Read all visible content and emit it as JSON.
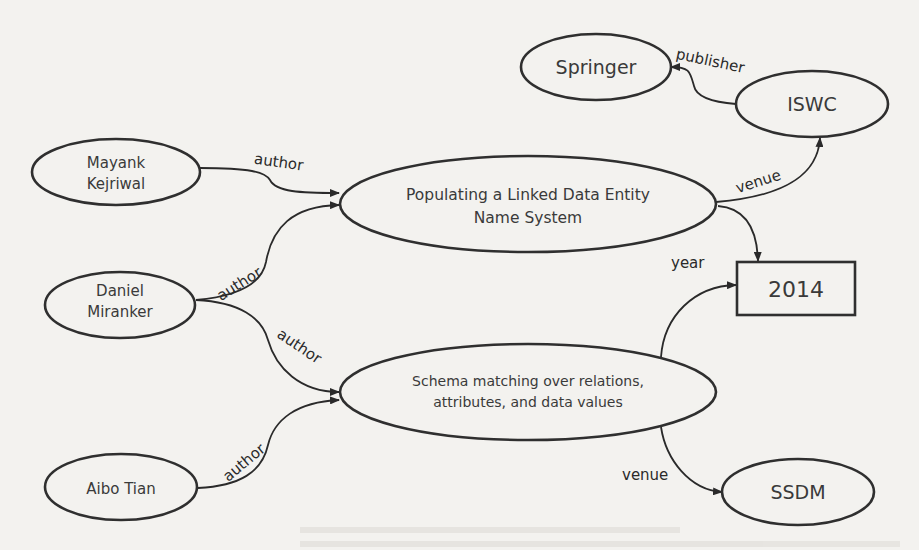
{
  "diagram": {
    "type": "knowledge-graph",
    "nodes": {
      "mayank": {
        "line1": "Mayank",
        "line2": "Kejriwal",
        "shape": "ellipse"
      },
      "daniel": {
        "line1": "Daniel",
        "line2": "Miranker",
        "shape": "ellipse"
      },
      "aibo": {
        "label": "Aibo Tian",
        "shape": "ellipse"
      },
      "paper1": {
        "line1": "Populating a Linked Data Entity",
        "line2": "Name System",
        "shape": "ellipse"
      },
      "paper2": {
        "line1": "Schema matching over relations,",
        "line2": "attributes, and data values",
        "shape": "ellipse"
      },
      "springer": {
        "label": "Springer",
        "shape": "ellipse"
      },
      "iswc": {
        "label": "ISWC",
        "shape": "ellipse"
      },
      "year2014": {
        "label": "2014",
        "shape": "rectangle"
      },
      "ssdm": {
        "label": "SSDM",
        "shape": "ellipse"
      }
    },
    "edges": [
      {
        "from": "Mayank Kejriwal",
        "to": "Populating a Linked Data Entity Name System",
        "label": "author"
      },
      {
        "from": "Daniel Miranker",
        "to": "Populating a Linked Data Entity Name System",
        "label": "author"
      },
      {
        "from": "Daniel Miranker",
        "to": "Schema matching over relations, attributes, and data values",
        "label": "author"
      },
      {
        "from": "Aibo Tian",
        "to": "Schema matching over relations, attributes, and data values",
        "label": "author"
      },
      {
        "from": "Populating a Linked Data Entity Name System",
        "to": "ISWC",
        "label": "venue"
      },
      {
        "from": "ISWC",
        "to": "Springer",
        "label": "publisher"
      },
      {
        "from": "Populating a Linked Data Entity Name System",
        "to": "2014",
        "label": "year"
      },
      {
        "from": "Schema matching over relations, attributes, and data values",
        "to": "2014",
        "label": "year"
      },
      {
        "from": "Schema matching over relations, attributes, and data values",
        "to": "SSDM",
        "label": "venue"
      }
    ],
    "edge_labels": {
      "author_mayank": "author",
      "author_daniel_p1": "author",
      "author_daniel_p2": "author",
      "author_aibo": "author",
      "venue_iswc": "venue",
      "publisher": "publisher",
      "year": "year",
      "venue_ssdm": "venue"
    }
  }
}
